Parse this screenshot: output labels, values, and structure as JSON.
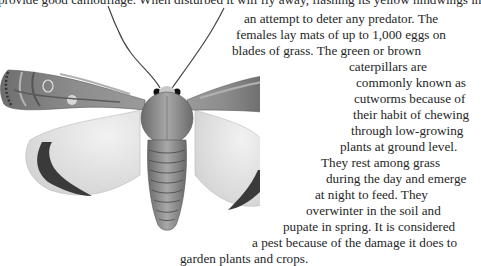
{
  "article": {
    "lines": [
      {
        "text": "provide good camouflage. When disturbed it will fly away, flashing its yellow hindwings in",
        "x": -2,
        "y": -8
      },
      {
        "text": "an attempt to deter any predator. The",
        "x": 244,
        "y": 11
      },
      {
        "text": "females lay mats of up to 1,000 eggs on",
        "x": 236,
        "y": 27
      },
      {
        "text": "blades of grass. The green or brown",
        "x": 232,
        "y": 43
      },
      {
        "text": "caterpillars are",
        "x": 349,
        "y": 59
      },
      {
        "text": "commonly known as",
        "x": 356,
        "y": 75
      },
      {
        "text": "cutworms because of",
        "x": 354,
        "y": 91
      },
      {
        "text": "their habit of chewing",
        "x": 353,
        "y": 107
      },
      {
        "text": "through low-growing",
        "x": 351,
        "y": 123
      },
      {
        "text": "plants at ground level.",
        "x": 340,
        "y": 139
      },
      {
        "text": "They rest among grass",
        "x": 321,
        "y": 155
      },
      {
        "text": "during the day and emerge",
        "x": 326,
        "y": 171
      },
      {
        "text": "at night to feed. They",
        "x": 315,
        "y": 187
      },
      {
        "text": "overwinter in the soil and",
        "x": 306,
        "y": 203
      },
      {
        "text": "pupate in spring. It is considered",
        "x": 283,
        "y": 219
      },
      {
        "text": "a pest because of the damage it does to",
        "x": 252,
        "y": 235
      },
      {
        "text": "garden plants and crops.",
        "x": 180,
        "y": 251
      }
    ]
  },
  "illustration": {
    "subject": "moth",
    "colors": {
      "forewing": "#7a7a7a",
      "forewing_dark": "#3e3e3e",
      "hindwing": "#e6e6e6",
      "hindwing_band": "#333333",
      "body": "#8a8a8a"
    }
  }
}
